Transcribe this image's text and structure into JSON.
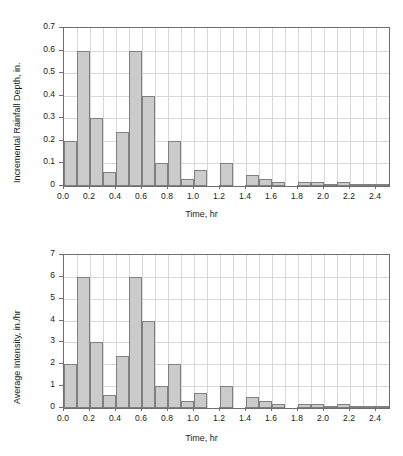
{
  "chart_data": [
    {
      "id": "incremental-rainfall-depth",
      "type": "bar",
      "title": "",
      "xlabel": "Time, hr",
      "ylabel": "Incremental Rainfall Depth, in.",
      "xlim": [
        0.0,
        2.5
      ],
      "ylim": [
        0.0,
        0.7
      ],
      "grid": true,
      "legend": null,
      "bar_width_hr": 0.1,
      "xticks": [
        "0.0",
        "0.2",
        "0.4",
        "0.6",
        "0.8",
        "1.0",
        "1.2",
        "1.4",
        "1.6",
        "1.8",
        "2.0",
        "2.2",
        "2.4"
      ],
      "xtick_values": [
        0.0,
        0.2,
        0.4,
        0.6,
        0.8,
        1.0,
        1.2,
        1.4,
        1.6,
        1.8,
        2.0,
        2.2,
        2.4
      ],
      "yticks": [
        "0",
        "0.1",
        "0.2",
        "0.3",
        "0.4",
        "0.5",
        "0.6",
        "0.7"
      ],
      "ytick_values": [
        0,
        0.1,
        0.2,
        0.3,
        0.4,
        0.5,
        0.6,
        0.7
      ],
      "bin_starts": [
        0.0,
        0.1,
        0.2,
        0.3,
        0.4,
        0.5,
        0.6,
        0.7,
        0.8,
        0.9,
        1.0,
        1.1,
        1.2,
        1.3,
        1.4,
        1.5,
        1.6,
        1.7,
        1.8,
        1.9,
        2.0,
        2.1,
        2.2,
        2.3,
        2.4
      ],
      "values": [
        0.2,
        0.6,
        0.3,
        0.06,
        0.24,
        0.6,
        0.4,
        0.1,
        0.2,
        0.03,
        0.07,
        0.0,
        0.1,
        0.0,
        0.05,
        0.03,
        0.02,
        0.0,
        0.02,
        0.02,
        0.01,
        0.02,
        0.01,
        0.01,
        0.01
      ]
    },
    {
      "id": "average-intensity",
      "type": "bar",
      "title": "",
      "xlabel": "Time, hr",
      "ylabel": "Average Intensity, in./hr",
      "xlim": [
        0.0,
        2.5
      ],
      "ylim": [
        0,
        7
      ],
      "grid": true,
      "legend": null,
      "bar_width_hr": 0.1,
      "xticks": [
        "0.0",
        "0.2",
        "0.4",
        "0.6",
        "0.8",
        "1.0",
        "1.2",
        "1.4",
        "1.6",
        "1.8",
        "2.0",
        "2.2",
        "2.4"
      ],
      "xtick_values": [
        0.0,
        0.2,
        0.4,
        0.6,
        0.8,
        1.0,
        1.2,
        1.4,
        1.6,
        1.8,
        2.0,
        2.2,
        2.4
      ],
      "yticks": [
        "0",
        "1",
        "2",
        "3",
        "4",
        "5",
        "6",
        "7"
      ],
      "ytick_values": [
        0,
        1,
        2,
        3,
        4,
        5,
        6,
        7
      ],
      "bin_starts": [
        0.0,
        0.1,
        0.2,
        0.3,
        0.4,
        0.5,
        0.6,
        0.7,
        0.8,
        0.9,
        1.0,
        1.1,
        1.2,
        1.3,
        1.4,
        1.5,
        1.6,
        1.7,
        1.8,
        1.9,
        2.0,
        2.1,
        2.2,
        2.3,
        2.4
      ],
      "values": [
        2.0,
        6.0,
        3.0,
        0.6,
        2.4,
        6.0,
        4.0,
        1.0,
        2.0,
        0.3,
        0.7,
        0.0,
        1.0,
        0.0,
        0.5,
        0.3,
        0.2,
        0.0,
        0.2,
        0.2,
        0.1,
        0.2,
        0.1,
        0.1,
        0.1
      ]
    }
  ],
  "style": {
    "bar_fill": "#cbcbcb",
    "bar_stroke": "#808080",
    "grid_color": "#d8d8d8",
    "axis_color": "#6e6e6e",
    "text_color": "#1a1a1a",
    "background": "#ffffff"
  }
}
